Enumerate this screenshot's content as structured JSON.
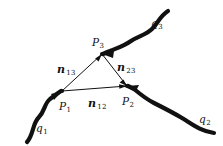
{
  "figure": {
    "background_color": "#ffffff",
    "stroke_color": "#111111",
    "points": [
      {
        "id": "P1",
        "label_base": "P",
        "label_sub": "1",
        "x": 62,
        "y": 91,
        "label_x": 59,
        "label_y": 97
      },
      {
        "id": "P2",
        "label_base": "P",
        "label_sub": "2",
        "x": 127,
        "y": 86,
        "label_x": 122,
        "label_y": 92
      },
      {
        "id": "P3",
        "label_base": "P",
        "label_sub": "3",
        "x": 102,
        "y": 54,
        "label_x": 92,
        "label_y": 33
      }
    ],
    "separations": [
      {
        "id": "n12",
        "label_base": "n",
        "label_sub": "12",
        "label_x": 88,
        "label_y": 94
      },
      {
        "id": "n13",
        "label_base": "n",
        "label_sub": "13",
        "label_x": 57,
        "label_y": 60
      },
      {
        "id": "n23",
        "label_base": "n",
        "label_sub": "23",
        "label_x": 117,
        "label_y": 58
      }
    ],
    "curves": [
      {
        "id": "q1",
        "label_base": "q",
        "label_sub": "1",
        "label_x": 36,
        "label_y": 119
      },
      {
        "id": "q2",
        "label_base": "q",
        "label_sub": "2",
        "label_x": 199,
        "label_y": 110
      },
      {
        "id": "q3",
        "label_base": "q",
        "label_sub": "3",
        "label_x": 151,
        "label_y": 14
      }
    ]
  }
}
